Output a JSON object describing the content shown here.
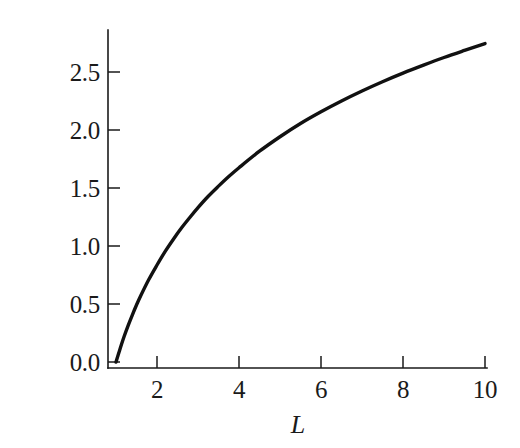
{
  "chart_data": {
    "type": "line",
    "title": "",
    "subtitle": "",
    "xlabel": "L",
    "ylabel": "表面積",
    "ylabel_chars": [
      "表",
      "面",
      "積"
    ],
    "xlim": [
      1,
      10.1
    ],
    "ylim": [
      0,
      2.95
    ],
    "xticks": [
      2,
      4,
      6,
      8,
      10
    ],
    "xtick_labels": [
      "2",
      "4",
      "6",
      "8",
      "10"
    ],
    "yticks": [
      0.0,
      0.5,
      1.0,
      1.5,
      2.0,
      2.5
    ],
    "ytick_labels": [
      "0.0",
      "0.5",
      "1.0",
      "1.5",
      "2.0",
      "2.5"
    ],
    "grid": false,
    "legend": null,
    "annotations": [],
    "series": [
      {
        "name": "surface-area-curve",
        "color": "#111111",
        "x": [
          1.0,
          1.1,
          1.2,
          1.3,
          1.4,
          1.5,
          1.6,
          1.8,
          2.0,
          2.2,
          2.4,
          2.6,
          2.8,
          3.0,
          3.25,
          3.5,
          3.75,
          4.0,
          4.5,
          5.0,
          5.5,
          6.0,
          6.5,
          7.0,
          7.5,
          8.0,
          8.5,
          9.0,
          9.5,
          10.0
        ],
        "y": [
          0.0,
          0.115,
          0.222,
          0.318,
          0.407,
          0.491,
          0.569,
          0.711,
          0.836,
          0.954,
          1.059,
          1.157,
          1.246,
          1.331,
          1.429,
          1.516,
          1.599,
          1.675,
          1.817,
          1.942,
          2.056,
          2.157,
          2.25,
          2.336,
          2.416,
          2.49,
          2.559,
          2.625,
          2.686,
          2.745
        ]
      }
    ]
  },
  "axes": {
    "tick_color": "#1a1a1a",
    "line_color": "#1a1a1a",
    "background": "#ffffff"
  }
}
